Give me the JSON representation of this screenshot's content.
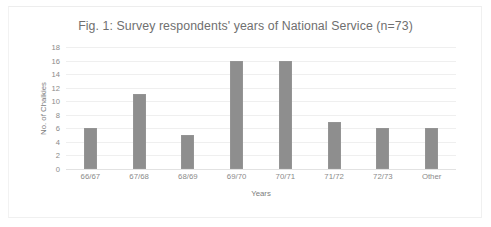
{
  "figure": {
    "title": "Fig. 1: Survey respondents' years of National Service (n=73)",
    "bar_color": "#8e8e8e",
    "background_color": "#ffffff",
    "gridline_color": "#efefef",
    "text_color": "#7b7b7b"
  },
  "chart_data": {
    "type": "bar",
    "title": "Fig. 1: Survey respondents' years of National Service (n=73)",
    "xlabel": "Years",
    "ylabel": "No. of Chalkies",
    "categories": [
      "66/67",
      "67/68",
      "68/69",
      "69/70",
      "70/71",
      "71/72",
      "72/73",
      "Other"
    ],
    "values": [
      6,
      11,
      5,
      16,
      16,
      7,
      6,
      6
    ],
    "ylim": [
      0,
      18
    ],
    "ytick_labels": [
      "18",
      "16",
      "14",
      "12",
      "10",
      "8",
      "6",
      "4",
      "2",
      "0"
    ],
    "yticks": [
      18,
      16,
      14,
      12,
      10,
      8,
      6,
      4,
      2,
      0
    ],
    "grid": "horizontal",
    "legend": "none",
    "total_n": 73
  }
}
